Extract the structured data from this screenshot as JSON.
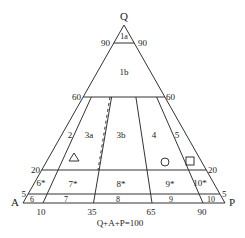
{
  "diagram": {
    "type": "QAPF ternary diagram (upper triangle)",
    "apices": {
      "top": "Q",
      "left": "A",
      "right": "P"
    },
    "caption": "Q+A+P=100",
    "q_lines": [
      {
        "value": "90",
        "left_label": "90",
        "right_label": "90"
      },
      {
        "value": "60",
        "left_label": "60",
        "right_label": "60"
      },
      {
        "value": "20",
        "left_label": "20",
        "right_label": "20"
      },
      {
        "value": "5",
        "left_label": "5",
        "right_label": "5"
      }
    ],
    "p_ratio_ticks": [
      "10",
      "35",
      "65",
      "90"
    ],
    "fields": [
      "1a",
      "1b",
      "2",
      "3a",
      "3b",
      "4",
      "5",
      "6*",
      "7*",
      "8*",
      "9*",
      "10*",
      "6",
      "7",
      "8",
      "9",
      "10"
    ],
    "symbols": [
      {
        "shape": "triangle",
        "field": "3a"
      },
      {
        "shape": "circle",
        "field": "4"
      },
      {
        "shape": "square",
        "field": "5"
      }
    ]
  }
}
